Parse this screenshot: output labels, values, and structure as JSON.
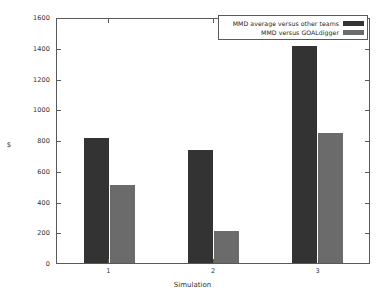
{
  "chart_data": {
    "type": "bar",
    "title": "",
    "subtitle": "",
    "xlabel": "Simulation",
    "ylabel": "$",
    "categories": [
      "1",
      "2",
      "3"
    ],
    "series": [
      {
        "name": "MMD average versus other teams",
        "color": "#333333",
        "values": [
          820,
          740,
          1420
        ]
      },
      {
        "name": "MMD versus GOALdigger",
        "color": "#6b6b6b",
        "values": [
          510,
          210,
          850
        ]
      }
    ],
    "ylim": [
      0,
      1600
    ],
    "ytick_labels": [
      "0",
      "200",
      "400",
      "600",
      "800",
      "1000",
      "1200",
      "1400",
      "1600"
    ],
    "ytick_values": [
      0,
      200,
      400,
      600,
      800,
      1000,
      1200,
      1400,
      1600
    ],
    "xtick_labels": [
      "1",
      "2",
      "3"
    ],
    "grid": false,
    "legend_position": "top-right",
    "background_color": "#ffffff",
    "axis_color": "#595959"
  }
}
